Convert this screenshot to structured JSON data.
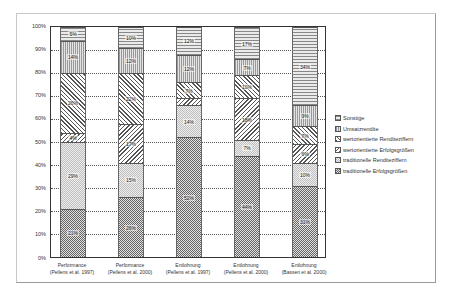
{
  "chart_data": {
    "type": "bar",
    "stacked": true,
    "title": "",
    "xlabel": "",
    "ylabel": "",
    "ylim": [
      0,
      100
    ],
    "yticks": [
      "0%",
      "10%",
      "20%",
      "30%",
      "40%",
      "50%",
      "60%",
      "70%",
      "80%",
      "90%",
      "100%"
    ],
    "grid": true,
    "legend_position": "right",
    "categories": [
      "Performance (Pellens et al. 1997)",
      "Performance (Pellens et al. 2000)",
      "Entlohnung (Pellens et al. 1997)",
      "Entlohnung (Pellens et al. 2000)",
      "Entlohnung (Bassen et al. 2000)"
    ],
    "series": [
      {
        "name": "traditionelle Erfolgsgrößen",
        "values": [
          21,
          26,
          52,
          44,
          31
        ]
      },
      {
        "name": "traditionelle Renditeziffern",
        "values": [
          29,
          15,
          14,
          7,
          10
        ]
      },
      {
        "name": "wertorientierte Erfolgsgrößen",
        "values": [
          4,
          17,
          3,
          18,
          6
        ]
      },
      {
        "name": "wertorientierte Renditeziffern",
        "values": [
          26,
          22,
          7,
          10,
          7
        ]
      },
      {
        "name": "Umsatzrendite",
        "values": [
          14,
          12,
          12,
          7,
          9
        ]
      },
      {
        "name": "Sonstige",
        "values": [
          5,
          10,
          12,
          17,
          34
        ]
      }
    ],
    "data_labels": [
      [
        "21%",
        "29%",
        "4%",
        "26%",
        "14%",
        "5%"
      ],
      [
        "26%",
        "15%",
        "17%",
        "22%",
        "12%",
        "10%"
      ],
      [
        "52%",
        "14%",
        "3%",
        "7%",
        "12%",
        "12%"
      ],
      [
        "44%",
        "7%",
        "18%",
        "10%",
        "7%",
        "17%"
      ],
      [
        "31%",
        "10%",
        "6%",
        "7%",
        "9%",
        "34%"
      ]
    ]
  },
  "axis": {
    "y": [
      "0%",
      "10%",
      "20%",
      "30%",
      "40%",
      "50%",
      "60%",
      "70%",
      "80%",
      "90%",
      "100%"
    ]
  },
  "xlabels": [
    {
      "l1": "Performance",
      "l2": "(Pellens et al. 1997)"
    },
    {
      "l1": "Performance",
      "l2": "(Pellens et al. 2000)"
    },
    {
      "l1": "Entlohnung",
      "l2": "(Pellens et al. 1997)"
    },
    {
      "l1": "Entlohnung",
      "l2": "(Pellens et al. 2000)"
    },
    {
      "l1": "Entlohnung",
      "l2": "(Bassen et al. 2000)"
    }
  ],
  "legend": [
    "Sonstige",
    "Umsatzrendite",
    "wertorientierte Renditeziffern",
    "wertorientierte Erfolgsgrößen",
    "traditionelle Renditeziffern",
    "traditionelle Erfolgsgrößen"
  ],
  "bars": [
    {
      "segs": [
        {
          "v": 21,
          "l": "21%"
        },
        {
          "v": 29,
          "l": "29%"
        },
        {
          "v": 4,
          "l": "4%"
        },
        {
          "v": 26,
          "l": "26%"
        },
        {
          "v": 14,
          "l": "14%"
        },
        {
          "v": 6,
          "l": "5%"
        }
      ]
    },
    {
      "segs": [
        {
          "v": 26,
          "l": "26%"
        },
        {
          "v": 15,
          "l": "15%"
        },
        {
          "v": 17,
          "l": "17%"
        },
        {
          "v": 22,
          "l": "22%"
        },
        {
          "v": 11,
          "l": "12%"
        },
        {
          "v": 9,
          "l": "10%"
        }
      ]
    },
    {
      "segs": [
        {
          "v": 52,
          "l": "52%"
        },
        {
          "v": 14,
          "l": "14%"
        },
        {
          "v": 3,
          "l": "3%"
        },
        {
          "v": 7,
          "l": "7%"
        },
        {
          "v": 12,
          "l": "12%"
        },
        {
          "v": 12,
          "l": "12%"
        }
      ]
    },
    {
      "segs": [
        {
          "v": 44,
          "l": "44%"
        },
        {
          "v": 7,
          "l": "7%"
        },
        {
          "v": 18,
          "l": "18%"
        },
        {
          "v": 10,
          "l": "10%"
        },
        {
          "v": 7,
          "l": "7%"
        },
        {
          "v": 14,
          "l": "17%"
        }
      ]
    },
    {
      "segs": [
        {
          "v": 31,
          "l": "31%"
        },
        {
          "v": 10,
          "l": "10%"
        },
        {
          "v": 8,
          "l": "6%"
        },
        {
          "v": 8,
          "l": "7%"
        },
        {
          "v": 9,
          "l": "9%"
        },
        {
          "v": 34,
          "l": "34%"
        }
      ]
    }
  ]
}
